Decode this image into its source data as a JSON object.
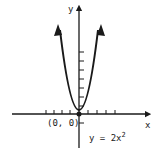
{
  "diagram": {
    "type": "function-graph",
    "function": "y = 2x^2",
    "axes": {
      "x_label": "x",
      "y_label": "y",
      "x_ticks_each_side": 4,
      "y_ticks_positive": 7,
      "y_ticks_negative": 1
    },
    "origin_label": "(0, 0)",
    "equation": {
      "prefix": "y = 2x",
      "exponent": "2"
    },
    "colors": {
      "ink": "#1a1a1a",
      "background": "#ffffff"
    }
  }
}
